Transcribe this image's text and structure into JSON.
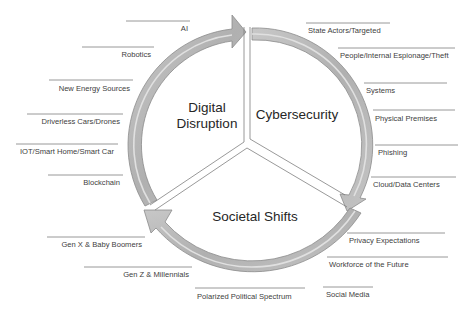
{
  "diagram": {
    "type": "cycle",
    "colors": {
      "arrow_fill": "#b4b4b4",
      "arrow_highlight": "#d9d9d9",
      "arrow_stroke": "#8c8c8c",
      "divider": "#7f7f7f",
      "label_line": "#7f7f7f",
      "text": "#404040",
      "background": "#ffffff"
    },
    "segments": [
      {
        "id": "digital",
        "title_line1": "Digital",
        "title_line2": "Disruption"
      },
      {
        "id": "cyber",
        "title_line1": "Cybersecurity"
      },
      {
        "id": "societal",
        "title_line1": "Societal Shifts"
      }
    ],
    "labels": {
      "digital": [
        "AI",
        "Robotics",
        "New Energy Sources",
        "Driverless Cars/Drones",
        "IOT/Smart Home/Smart Car",
        "Blockchain"
      ],
      "cyber": [
        "State Actors/Targeted",
        "People/Internal Espionage/Theft",
        "Systems",
        "Physical Premises",
        "Phishing",
        "Cloud/Data Centers"
      ],
      "societal": [
        "Gen X & Baby Boomers",
        "Gen Z & Millennials",
        "Polarized Political Spectrum",
        "Social Media",
        "Workforce of the Future",
        "Privacy Expectations"
      ]
    }
  }
}
